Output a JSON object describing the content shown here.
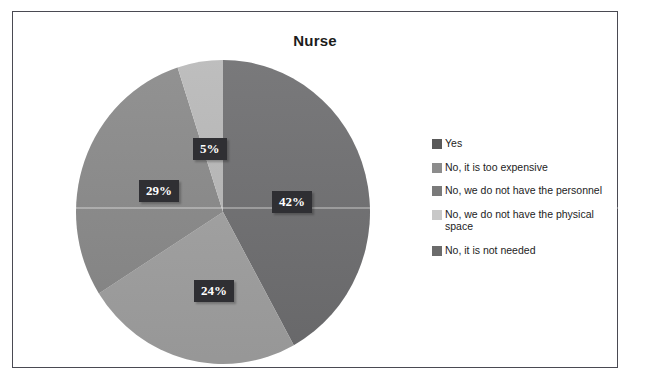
{
  "figure": {
    "title": "Nurse",
    "frame_border_color": "#4a4a52",
    "background_color": "#ffffff"
  },
  "chart_data": {
    "type": "pie",
    "title": "Nurse",
    "xlabel": "",
    "ylabel": "",
    "grid": false,
    "legend_position": "right",
    "start_angle_deg": 0,
    "direction": "clockwise",
    "categories": [
      "Yes",
      "No, it is too expensive",
      "No, we do not have the personnel",
      "No, we do not have the physical space",
      "No, it is not needed"
    ],
    "values": [
      42,
      24,
      29,
      5,
      0
    ],
    "value_labels": [
      "42%",
      "24%",
      "29%",
      "5%",
      ""
    ],
    "colors": [
      "#6f6f71",
      "#a2a2a2",
      "#8a8a8a",
      "#b9b9b9",
      "#7e7e7e"
    ],
    "slices": [
      {
        "label": "Yes",
        "value": 42,
        "display": "42%",
        "color": "#6f6f71"
      },
      {
        "label": "No, it is too expensive",
        "value": 24,
        "display": "24%",
        "color": "#a2a2a2"
      },
      {
        "label": "No, we do not have the personnel",
        "value": 29,
        "display": "29%",
        "color": "#8a8a8a"
      },
      {
        "label": "No, we do not have the physical space",
        "value": 5,
        "display": "5%",
        "color": "#b9b9b9"
      },
      {
        "label": "No, it is not needed",
        "value": 0,
        "display": "",
        "color": "#7e7e7e"
      }
    ]
  },
  "labels": {
    "yes": "42%",
    "too_expensive": "24%",
    "personnel": "29%",
    "physical_space": "5%"
  },
  "legend": {
    "items": [
      {
        "label": "Yes",
        "swatch_color": "#595959"
      },
      {
        "label": "No, it is too expensive",
        "swatch_color": "#8c8c8c"
      },
      {
        "label": "No, we do not have the personnel",
        "swatch_color": "#7a7a7a"
      },
      {
        "label": "No, we do not have the physical space",
        "swatch_color": "#c8c8c8"
      },
      {
        "label": "No, it is not needed",
        "swatch_color": "#6b6b6b"
      }
    ]
  }
}
